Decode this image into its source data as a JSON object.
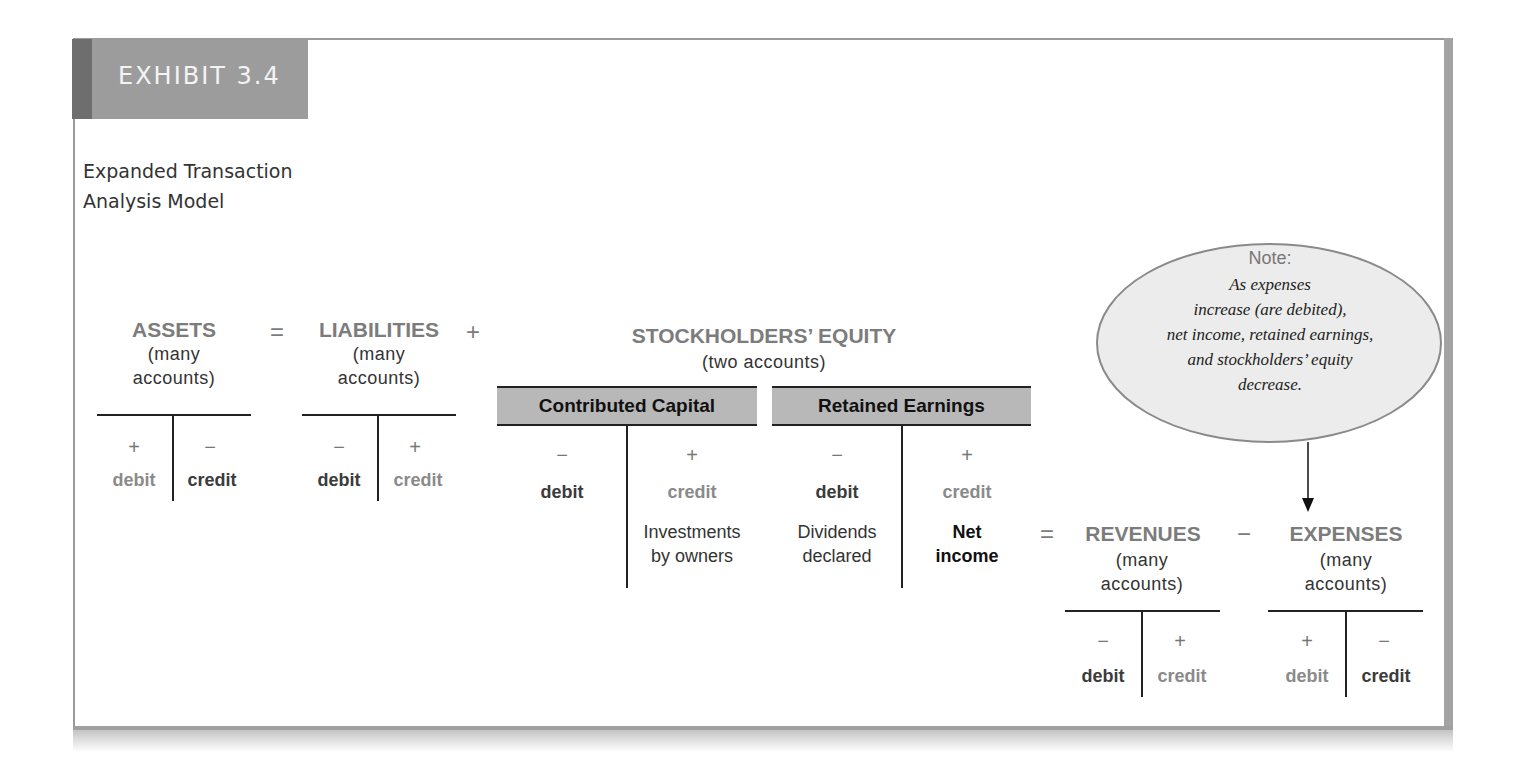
{
  "exhibit": {
    "label": "EXHIBIT 3.4",
    "subtitle_lines": [
      "Expanded Transaction",
      "Analysis Model"
    ]
  },
  "equation": {
    "operators": {
      "equals1": "=",
      "plus": "+",
      "equals2": "=",
      "minus": "−"
    },
    "assets": {
      "title": "ASSETS",
      "sub_lines": [
        "(many",
        "accounts)"
      ],
      "left_sign": "+",
      "right_sign": "−",
      "left_label": "debit",
      "right_label": "credit"
    },
    "liabilities": {
      "title": "LIABILITIES",
      "sub_lines": [
        "(many",
        "accounts)"
      ],
      "left_sign": "−",
      "right_sign": "+",
      "left_label": "debit",
      "right_label": "credit"
    },
    "stockholders_equity": {
      "title": "STOCKHOLDERS’ EQUITY",
      "sub": "(two accounts)",
      "contributed_capital": {
        "title": "Contributed Capital",
        "left_sign": "−",
        "right_sign": "+",
        "left_label": "debit",
        "right_label": "credit",
        "right_entry_lines": [
          "Investments",
          "by owners"
        ]
      },
      "retained_earnings": {
        "title": "Retained Earnings",
        "left_sign": "−",
        "right_sign": "+",
        "left_label": "debit",
        "right_label": "credit",
        "left_entry_lines": [
          "Dividends",
          "declared"
        ],
        "right_entry_lines": [
          "Net",
          "income"
        ]
      }
    },
    "revenues": {
      "title": "REVENUES",
      "sub_lines": [
        "(many",
        "accounts)"
      ],
      "left_sign": "−",
      "right_sign": "+",
      "left_label": "debit",
      "right_label": "credit"
    },
    "expenses": {
      "title": "EXPENSES",
      "sub_lines": [
        "(many",
        "accounts)"
      ],
      "left_sign": "+",
      "right_sign": "−",
      "left_label": "debit",
      "right_label": "credit"
    }
  },
  "note": {
    "title": "Note:",
    "body_lines": [
      "As expenses",
      "increase (are debited),",
      "net income, retained earnings,",
      "and stockholders’ equity",
      "decrease."
    ]
  },
  "colors": {
    "exhibit_box": "#9c9c9c",
    "exhibit_stripe": "#6e6e6e",
    "heading_gray": "#7c7c7c",
    "account_box": "#b8b8b8",
    "note_fill": "#ececec"
  }
}
